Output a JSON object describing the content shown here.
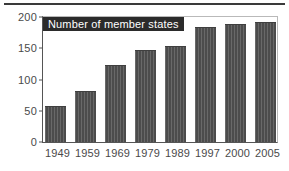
{
  "figure": {
    "top_rule": "horizontal-rule",
    "accent_color": "#4c4c4c",
    "frame_color": "#555555",
    "title_banner_bg": "#2b2b2b",
    "title_banner_fg": "#ffffff"
  },
  "chart_data": {
    "type": "bar",
    "title": "Number of member states",
    "xlabel": "",
    "ylabel": "",
    "categories": [
      "1949",
      "1959",
      "1969",
      "1979",
      "1989",
      "1997",
      "2000",
      "2005"
    ],
    "values": [
      57,
      81,
      124,
      148,
      154,
      184,
      189,
      192
    ],
    "ylim": [
      0,
      200
    ],
    "yticks": [
      "0",
      "50",
      "100",
      "150",
      "200"
    ],
    "ytick_values": [
      0,
      50,
      100,
      150,
      200
    ],
    "grid": false,
    "legend": false,
    "series": [
      {
        "name": "Number of member states",
        "values": [
          57,
          81,
          124,
          148,
          154,
          184,
          189,
          192
        ]
      }
    ]
  }
}
